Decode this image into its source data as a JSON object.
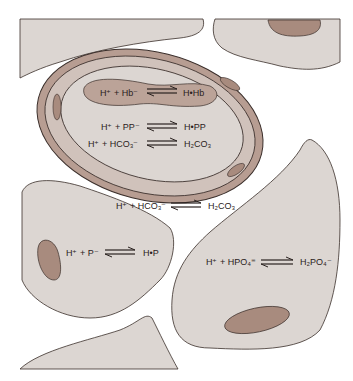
{
  "diagram": {
    "colors": {
      "background": "#ffffff",
      "cell_fill": "#dcd6d2",
      "cell_stroke": "#3a2e2a",
      "nucleus_fill": "#a88b7e",
      "rbc_membrane_fill": "#b79d92",
      "rbc_inner_fill": "#d8cdc7",
      "hb_region_fill": "#bba398",
      "text": "#2a2220"
    },
    "equations": {
      "hemoglobin": {
        "left": "H⁺ + Hb⁻",
        "arrow": "⇌",
        "right": "H•Hb"
      },
      "plasma_protein": {
        "left": "H⁺ + PP⁻",
        "arrow": "⇌",
        "right": "H•PP"
      },
      "rbc_bicarbonate": {
        "left": "H⁺ + HCO₃⁻",
        "arrow": "⇌",
        "right": "H₂CO₃"
      },
      "interstitial_bicarbonate": {
        "left": "H⁺ + HCO₃⁻",
        "arrow": "⇌",
        "right": "H₂CO₃"
      },
      "protein": {
        "left": "H⁺ + P⁻",
        "arrow": "⇌",
        "right": "H•P"
      },
      "phosphate": {
        "left": "H⁺ + HPO₄⁼",
        "arrow": "⇌",
        "right": "H₂PO₄⁻"
      }
    }
  }
}
